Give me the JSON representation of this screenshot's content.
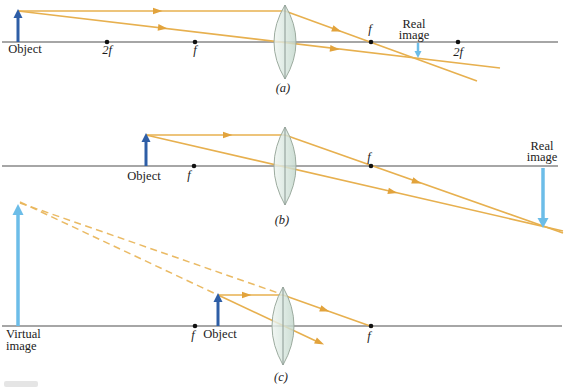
{
  "panels": {
    "a": {
      "caption": "(a)",
      "object_label": "Object",
      "focal_left_2f": "2f",
      "focal_left_f": "f",
      "focal_right_f": "f",
      "focal_right_2f": "2f",
      "image_label_line1": "Real",
      "image_label_line2": "image"
    },
    "b": {
      "caption": "(b)",
      "object_label": "Object",
      "focal_left_f": "f",
      "focal_right_f": "f",
      "image_label_line1": "Real",
      "image_label_line2": "image"
    },
    "c": {
      "caption": "(c)",
      "object_label": "Object",
      "focal_left_f": "f",
      "focal_right_f": "f",
      "image_label_line1": "Virtual",
      "image_label_line2": "image"
    }
  },
  "colors": {
    "ray": "#e7b04f",
    "ray_arrowhead": "#e2a33c",
    "object_arrow": "#2e5ea6",
    "image_arrow": "#6cbde8",
    "lens_fill": "#d8e7df",
    "lens_stroke": "#9cab9f",
    "axis": "#4f4f4f",
    "focal_dot": "#111111",
    "label_text": "#1b1b1b"
  }
}
